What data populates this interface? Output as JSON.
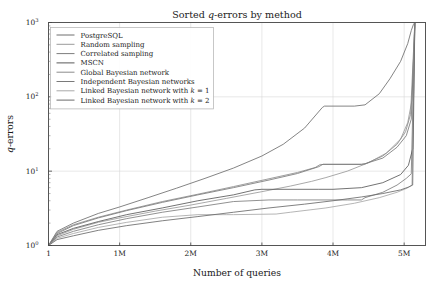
{
  "chart_data": {
    "type": "line",
    "title": "Sorted q-errors by method",
    "title_parts": {
      "pre": "Sorted ",
      "ital": "q",
      "post": "-errors by method"
    },
    "xlabel": "Number of queries",
    "ylabel": "q-errors",
    "ylabel_parts": {
      "ital": "q",
      "post": "-errors"
    },
    "xscale": "linear",
    "yscale": "log",
    "xlim": [
      0,
      5300000
    ],
    "ylim": [
      1,
      1000
    ],
    "grid": true,
    "grid_color": "#d9d9d9",
    "legend_position": "upper left",
    "xticks": [
      {
        "value": 1,
        "label": "1"
      },
      {
        "value": 1000000,
        "label": "1M"
      },
      {
        "value": 2000000,
        "label": "2M"
      },
      {
        "value": 3000000,
        "label": "3M"
      },
      {
        "value": 4000000,
        "label": "4M"
      },
      {
        "value": 5000000,
        "label": "5M"
      }
    ],
    "yticks": [
      {
        "value": 1,
        "mantissa": "10",
        "exponent": "0"
      },
      {
        "value": 10,
        "mantissa": "10",
        "exponent": "1"
      },
      {
        "value": 100,
        "mantissa": "10",
        "exponent": "2"
      },
      {
        "value": 1000,
        "mantissa": "10",
        "exponent": "3"
      }
    ],
    "series": [
      {
        "name": "PostgreSQL",
        "label": "PostgreSQL",
        "color": "#6e6e6e",
        "x": [
          1,
          120000,
          350000,
          700000,
          1000000,
          1400000,
          1800000,
          2200000,
          2600000,
          3000000,
          3300000,
          3600000,
          3850000,
          3880000,
          4300000,
          4450000,
          4650000,
          4800000,
          4950000,
          5050000,
          5100000,
          5130000,
          5150000
        ],
        "y": [
          1.0,
          1.55,
          2.0,
          2.7,
          3.3,
          4.4,
          5.9,
          8.0,
          11.0,
          16.0,
          23.0,
          38.0,
          72.0,
          75.0,
          75.0,
          78.0,
          110.0,
          175.0,
          300.0,
          520.0,
          780.0,
          940.0,
          1000.0
        ]
      },
      {
        "name": "Random sampling",
        "label": "Random sampling",
        "color": "#9a9a9a",
        "x": [
          1,
          120000,
          350000,
          700000,
          1000000,
          1500000,
          2000000,
          2500000,
          3000000,
          3400000,
          3700000,
          3900000,
          4200000,
          4500000,
          4750000,
          4950000,
          5050000,
          5110000,
          5150000
        ],
        "y": [
          1.0,
          1.35,
          1.65,
          2.05,
          2.35,
          2.9,
          3.5,
          4.3,
          5.3,
          6.3,
          7.3,
          8.2,
          10.0,
          13.0,
          17.5,
          27.0,
          45.0,
          90.0,
          1000.0
        ]
      },
      {
        "name": "Correlated sampling",
        "label": "Correlated sampling",
        "color": "#7d7d7d",
        "x": [
          1,
          120000,
          350000,
          700000,
          1100000,
          1600000,
          2100000,
          2600000,
          3100000,
          3450000,
          3500000,
          4200000,
          4400000,
          4450000,
          4700000,
          4900000,
          5030000,
          5100000,
          5150000
        ],
        "y": [
          1.0,
          1.3,
          1.55,
          1.9,
          2.3,
          2.8,
          3.3,
          3.9,
          4.1,
          4.1,
          4.1,
          4.1,
          4.1,
          4.4,
          5.2,
          6.5,
          8.0,
          9.2,
          1000.0
        ]
      },
      {
        "name": "MSCN",
        "label": "MSCN",
        "color": "#5a5a5a",
        "x": [
          1,
          120000,
          350000,
          700000,
          1100000,
          1600000,
          2100000,
          2600000,
          2900000,
          3000000,
          3800000,
          4000000,
          4400000,
          4700000,
          4950000,
          5060000,
          5120000,
          5150000
        ],
        "y": [
          1.0,
          1.4,
          1.7,
          2.1,
          2.6,
          3.2,
          4.0,
          4.8,
          5.6,
          5.7,
          5.7,
          5.7,
          6.0,
          7.0,
          9.0,
          12.0,
          20.0,
          1000.0
        ]
      },
      {
        "name": "Global Bayesian network",
        "label": "Global Bayesian network",
        "color": "#8c8c8c",
        "x": [
          1,
          120000,
          350000,
          700000,
          1100000,
          1600000,
          2100000,
          2600000,
          3100000,
          3500000,
          3750000,
          3820000,
          4400000,
          4450000,
          4700000,
          4900000,
          5020000,
          5090000,
          5150000
        ],
        "y": [
          1.0,
          1.5,
          1.9,
          2.4,
          3.0,
          3.9,
          4.9,
          6.2,
          7.9,
          9.6,
          11.2,
          12.3,
          12.3,
          12.5,
          16.0,
          23.0,
          34.0,
          58.0,
          1000.0
        ]
      },
      {
        "name": "Independent Bayesian networks",
        "label": "Independent Bayesian networks",
        "color": "#7a7a7a",
        "x": [
          1,
          120000,
          350000,
          700000,
          1100000,
          1600000,
          2100000,
          2600000,
          3100000,
          3500000,
          3800000,
          3860000,
          4400000,
          4450000,
          4700000,
          4900000,
          5030000,
          5100000,
          5150000
        ],
        "y": [
          1.0,
          1.45,
          1.85,
          2.35,
          2.95,
          3.8,
          4.8,
          6.0,
          7.6,
          9.3,
          11.5,
          12.4,
          12.4,
          12.6,
          15.0,
          21.0,
          30.0,
          50.0,
          1000.0
        ]
      },
      {
        "name": "Linked Bayesian network with k = 1",
        "label_pre": "Linked Bayesian network with ",
        "label_ital": "k",
        "label_post": " = 1",
        "label": "Linked Bayesian network with k = 1",
        "color": "#a8a8a8",
        "x": [
          1,
          120000,
          350000,
          700000,
          1100000,
          1600000,
          2100000,
          2500000,
          2600000,
          3200000,
          3400000,
          3900000,
          4300000,
          4650000,
          4900000,
          5040000,
          5110000,
          5150000
        ],
        "y": [
          1.0,
          1.25,
          1.45,
          1.75,
          2.05,
          2.4,
          2.6,
          2.6,
          2.6,
          2.65,
          2.8,
          3.2,
          3.7,
          4.4,
          5.2,
          5.9,
          6.5,
          1000.0
        ]
      },
      {
        "name": "Linked Bayesian network with k = 2",
        "label_pre": "Linked Bayesian network with ",
        "label_ital": "k",
        "label_post": " = 2",
        "label": "Linked Bayesian network with k = 2",
        "color": "#6a6a6a",
        "x": [
          1,
          120000,
          350000,
          700000,
          1100000,
          1600000,
          2100000,
          2600000,
          3100000,
          3600000,
          4000000,
          4400000,
          4700000,
          4950000,
          5060000,
          5120000,
          5150000
        ],
        "y": [
          1.0,
          1.2,
          1.35,
          1.6,
          1.85,
          2.15,
          2.45,
          2.8,
          3.2,
          3.6,
          4.0,
          4.5,
          5.0,
          5.6,
          6.1,
          6.5,
          1000.0
        ]
      }
    ]
  }
}
